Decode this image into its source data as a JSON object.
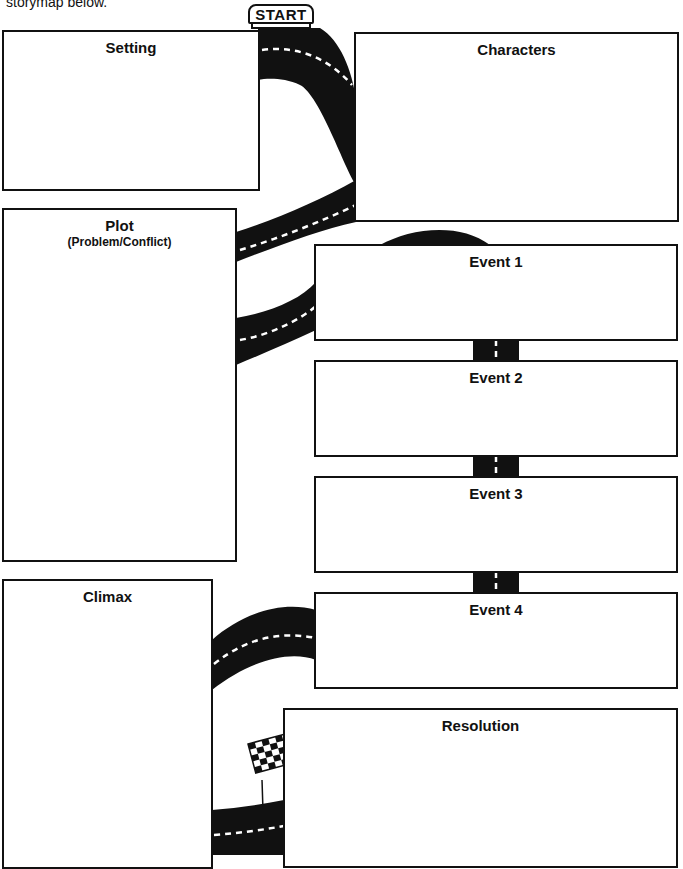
{
  "intro_text": "storymap below.",
  "start_sign": {
    "label": "START"
  },
  "boxes": {
    "setting": {
      "title": "Setting"
    },
    "characters": {
      "title": "Characters"
    },
    "plot": {
      "title": "Plot",
      "subtitle": "(Problem/Conflict)"
    },
    "event1": {
      "title": "Event 1"
    },
    "event2": {
      "title": "Event 2"
    },
    "event3": {
      "title": "Event 3"
    },
    "event4": {
      "title": "Event 4"
    },
    "climax": {
      "title": "Climax"
    },
    "resolution": {
      "title": "Resolution"
    }
  },
  "icons": {
    "start": "start-sign-icon",
    "finish": "checkered-flag-icon",
    "road": "road-icon"
  },
  "colors": {
    "ink": "#111111",
    "paper": "#ffffff",
    "lane": "#ffffff"
  }
}
